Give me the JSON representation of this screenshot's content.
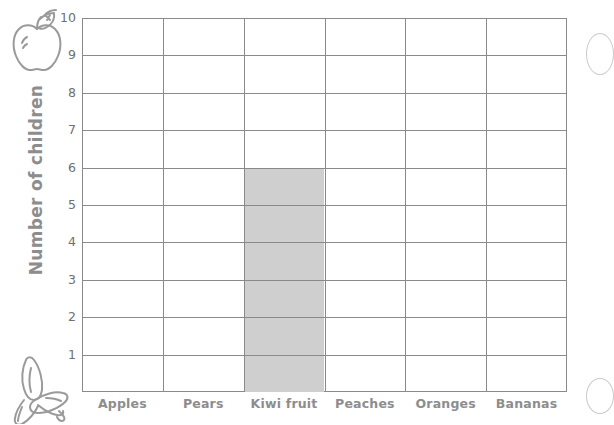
{
  "chart_data": {
    "type": "bar",
    "title": "",
    "subtitle": "",
    "xlabel": "",
    "ylabel": "Number of children",
    "categories": [
      "Apples",
      "Pears",
      "Kiwi fruit",
      "Peaches",
      "Oranges",
      "Bananas"
    ],
    "values": [
      0,
      0,
      6,
      0,
      0,
      0
    ],
    "ylim": [
      0,
      10
    ],
    "ytick_labels": [
      "1",
      "2",
      "3",
      "4",
      "5",
      "6",
      "7",
      "8",
      "9",
      "10"
    ],
    "ytick_values": [
      1,
      2,
      3,
      4,
      5,
      6,
      7,
      8,
      9,
      10
    ],
    "grid": true,
    "legend": "none",
    "bar_color": "#cfcfcf",
    "grid_color": "#8a8a8a",
    "label_color": "#8d8d8d",
    "background": "#ffffff"
  },
  "axis": {
    "y_title": "Number of children"
  },
  "decorations": {
    "apple_icon_name": "apple-icon",
    "banana_icon_name": "banana-icon",
    "edge_top_name": "partial-circle-decoration-top",
    "edge_bottom_name": "partial-circle-decoration-bottom"
  }
}
